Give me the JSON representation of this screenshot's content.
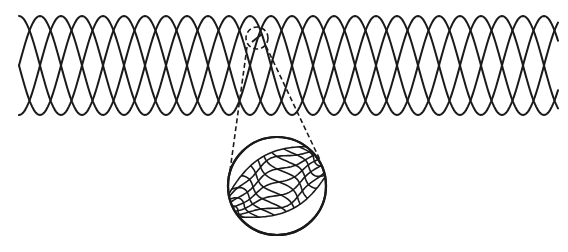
{
  "figure": {
    "title": "",
    "stroke_color": "#1a1a1a",
    "background": "#ffffff",
    "mesh": {
      "x_start": 19,
      "x_end": 558,
      "y_top": 16,
      "y_bottom": 115,
      "wire_count": 4,
      "period_px": 84,
      "phase_step_px": 21
    },
    "detail_marker": {
      "cx": 257,
      "cy": 38,
      "r": 11,
      "style": "dashed"
    },
    "magnified_view": {
      "cx": 277,
      "cy": 186,
      "r": 49,
      "style": "solid"
    },
    "leader_lines": [
      {
        "from": [
          247,
          47
        ],
        "to": [
          229,
          178
        ]
      },
      {
        "from": [
          266,
          46
        ],
        "to": [
          320,
          160
        ]
      }
    ]
  }
}
